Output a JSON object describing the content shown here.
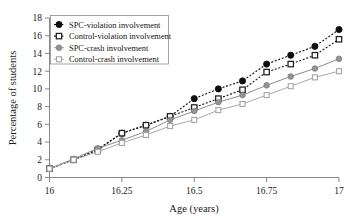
{
  "chart_data": {
    "type": "line",
    "title": "",
    "xlabel": "Age (years)",
    "ylabel": "Percentage of students",
    "xlim": [
      16,
      17
    ],
    "ylim": [
      0,
      18
    ],
    "grid": false,
    "legend_position": "upper-left",
    "xticks": [
      16,
      16.25,
      16.5,
      16.75,
      17
    ],
    "xticklabels": [
      "16",
      "16.25",
      "16.5",
      "16.75",
      "17"
    ],
    "yticks": [
      0,
      2,
      4,
      6,
      8,
      10,
      12,
      14,
      16,
      18
    ],
    "yticklabels": [
      "0",
      "2",
      "4",
      "6",
      "8",
      "10",
      "12",
      "14",
      "16",
      "18"
    ],
    "x": [
      16.0,
      16.0833,
      16.1667,
      16.25,
      16.3333,
      16.4167,
      16.5,
      16.5833,
      16.6667,
      16.75,
      16.8333,
      16.9167,
      17.0
    ],
    "series": [
      {
        "name": "SPC-violation involvement",
        "marker": "filled-circle",
        "color": "#111111",
        "linestyle": "dotted",
        "values": [
          1.0,
          2.0,
          3.2,
          5.0,
          5.9,
          6.9,
          8.9,
          10.0,
          10.9,
          12.8,
          13.8,
          14.8,
          16.7
        ]
      },
      {
        "name": "Control-violation involvement",
        "marker": "open-square",
        "color": "#1f1f1f",
        "linestyle": "dotted",
        "values": [
          1.0,
          2.0,
          3.1,
          5.0,
          5.9,
          6.9,
          7.9,
          8.9,
          9.9,
          11.9,
          12.8,
          13.8,
          15.6
        ]
      },
      {
        "name": "SPC-crash involvement",
        "marker": "filled-circle-gray",
        "color": "#8e8e8e",
        "linestyle": "solid",
        "values": [
          1.0,
          2.1,
          3.3,
          4.2,
          5.2,
          6.5,
          7.5,
          8.5,
          9.3,
          10.4,
          11.4,
          12.3,
          13.4
        ]
      },
      {
        "name": "Control-crash involvement",
        "marker": "open-square-gray",
        "color": "#a8a8a8",
        "linestyle": "solid",
        "values": [
          1.0,
          2.0,
          2.9,
          3.9,
          4.8,
          5.8,
          6.5,
          7.6,
          8.3,
          9.3,
          10.3,
          11.3,
          12.0
        ]
      }
    ]
  },
  "colors": {
    "axis": "#7a7a7a",
    "text": "#1a1a1a",
    "series_dark": "#111111",
    "series_gray": "#8e8e8e",
    "series_light_gray": "#a8a8a8",
    "background": "#ffffff",
    "legend_border": "#8c8c8c"
  }
}
